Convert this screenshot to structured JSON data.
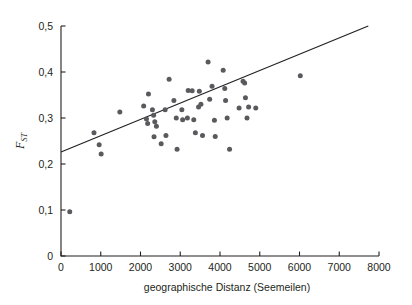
{
  "chart_data": {
    "type": "scatter",
    "title": "",
    "xlabel": "geographische Distanz (Seemeilen)",
    "ylabel": "FST",
    "ylabel_main": "F",
    "ylabel_sub": "ST",
    "xlim": [
      0,
      8000
    ],
    "ylim": [
      0,
      0.5
    ],
    "grid": false,
    "legend": null,
    "xticks": [
      0,
      1000,
      2000,
      3000,
      4000,
      5000,
      6000,
      7000,
      8000
    ],
    "xtick_labels": [
      "0",
      "1000",
      "2000",
      "3000",
      "4000",
      "5000",
      "6000",
      "7000",
      "8000"
    ],
    "yticks": [
      0,
      0.1,
      0.2,
      0.3,
      0.4,
      0.5
    ],
    "ytick_labels": [
      "0",
      "0,1",
      "0,2",
      "0,3",
      "0,4",
      "0,5"
    ],
    "point_color": "#5a5a5e",
    "line_color": "#231f20",
    "trend_line": {
      "x": [
        0,
        7730
      ],
      "y": [
        0.226,
        0.5
      ]
    },
    "points": [
      {
        "x": 220,
        "y": 0.096
      },
      {
        "x": 830,
        "y": 0.268
      },
      {
        "x": 960,
        "y": 0.242
      },
      {
        "x": 1010,
        "y": 0.222
      },
      {
        "x": 1480,
        "y": 0.313
      },
      {
        "x": 2080,
        "y": 0.326
      },
      {
        "x": 2150,
        "y": 0.298
      },
      {
        "x": 2180,
        "y": 0.288
      },
      {
        "x": 2200,
        "y": 0.352
      },
      {
        "x": 2300,
        "y": 0.318
      },
      {
        "x": 2330,
        "y": 0.306
      },
      {
        "x": 2340,
        "y": 0.259
      },
      {
        "x": 2360,
        "y": 0.292
      },
      {
        "x": 2400,
        "y": 0.282
      },
      {
        "x": 2520,
        "y": 0.244
      },
      {
        "x": 2620,
        "y": 0.318
      },
      {
        "x": 2640,
        "y": 0.262
      },
      {
        "x": 2720,
        "y": 0.384
      },
      {
        "x": 2840,
        "y": 0.338
      },
      {
        "x": 2900,
        "y": 0.3
      },
      {
        "x": 2920,
        "y": 0.232
      },
      {
        "x": 3040,
        "y": 0.318
      },
      {
        "x": 3060,
        "y": 0.296
      },
      {
        "x": 3180,
        "y": 0.3
      },
      {
        "x": 3200,
        "y": 0.36
      },
      {
        "x": 3300,
        "y": 0.359
      },
      {
        "x": 3340,
        "y": 0.296
      },
      {
        "x": 3380,
        "y": 0.268
      },
      {
        "x": 3460,
        "y": 0.324
      },
      {
        "x": 3480,
        "y": 0.358
      },
      {
        "x": 3520,
        "y": 0.33
      },
      {
        "x": 3560,
        "y": 0.262
      },
      {
        "x": 3700,
        "y": 0.422
      },
      {
        "x": 3740,
        "y": 0.341
      },
      {
        "x": 3800,
        "y": 0.369
      },
      {
        "x": 3860,
        "y": 0.295
      },
      {
        "x": 3880,
        "y": 0.26
      },
      {
        "x": 4080,
        "y": 0.404
      },
      {
        "x": 4120,
        "y": 0.364
      },
      {
        "x": 4140,
        "y": 0.338
      },
      {
        "x": 4180,
        "y": 0.3
      },
      {
        "x": 4240,
        "y": 0.232
      },
      {
        "x": 4480,
        "y": 0.322
      },
      {
        "x": 4580,
        "y": 0.38
      },
      {
        "x": 4620,
        "y": 0.376
      },
      {
        "x": 4640,
        "y": 0.344
      },
      {
        "x": 4680,
        "y": 0.3
      },
      {
        "x": 4720,
        "y": 0.324
      },
      {
        "x": 4900,
        "y": 0.322
      },
      {
        "x": 6020,
        "y": 0.392
      }
    ]
  }
}
